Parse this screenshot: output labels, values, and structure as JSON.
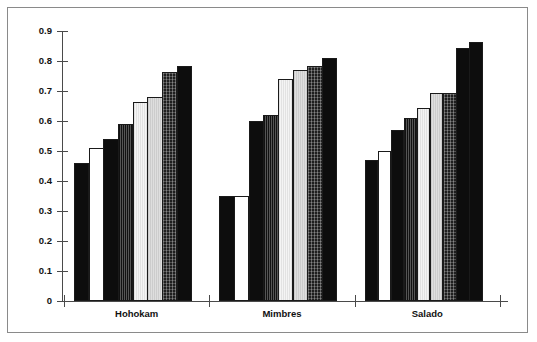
{
  "chart_data": {
    "type": "bar",
    "title": "",
    "subtitle": "",
    "xlabel": "",
    "ylabel": "",
    "categories": [
      "Hohokam",
      "Mimbres",
      "Salado"
    ],
    "ylim": [
      0,
      0.9
    ],
    "yticks": [
      0,
      0.1,
      0.2,
      0.3,
      0.4,
      0.5,
      0.6,
      0.7,
      0.8,
      0.9
    ],
    "ytick_labels": [
      "0",
      "0.1",
      "0.2",
      "0.3",
      "0.4",
      "0.5",
      "0.6",
      "0.7",
      "0.8",
      "0.9"
    ],
    "grid": false,
    "legend": "none",
    "axis_frame": "left-and-bottom",
    "series": [
      {
        "name": "Series 1",
        "fill": "black",
        "values": [
          0.46,
          0.35,
          0.47
        ]
      },
      {
        "name": "Series 2",
        "fill": "white",
        "values": [
          0.51,
          0.35,
          0.5
        ]
      },
      {
        "name": "Series 3",
        "fill": "black",
        "values": [
          0.54,
          0.6,
          0.57
        ]
      },
      {
        "name": "Series 4",
        "fill": "vhatch-dark",
        "values": [
          0.59,
          0.62,
          0.61
        ]
      },
      {
        "name": "Series 5",
        "fill": "light",
        "values": [
          0.665,
          0.74,
          0.645
        ]
      },
      {
        "name": "Series 6",
        "fill": "lightgray",
        "values": [
          0.68,
          0.77,
          0.695
        ]
      },
      {
        "name": "Series 7",
        "fill": "speckle",
        "values": [
          0.765,
          0.785,
          0.695
        ]
      },
      {
        "name": "Series 8",
        "fill": "black",
        "values": [
          0.785,
          0.81,
          0.845
        ]
      },
      {
        "name": "Series 9",
        "fill": "black",
        "values": [
          null,
          null,
          0.865
        ]
      }
    ],
    "group_bar_counts": [
      8,
      8,
      9
    ]
  },
  "axis": {
    "y_labels": [
      "0.9",
      "0.8",
      "0.7",
      "0.6",
      "0.5",
      "0.4",
      "0.3",
      "0.2",
      "0.1",
      "0"
    ]
  },
  "groups": [
    {
      "label": "Hohokam"
    },
    {
      "label": "Mimbres"
    },
    {
      "label": "Salado"
    }
  ],
  "colors": {
    "frame": "#8a8a8a",
    "axis": "#4a4a4a",
    "text": "#111111",
    "bar_dark": "#0d0d0d",
    "bar_light": "#ebebeb",
    "bar_lightgray": "#d5d5d5",
    "bar_speckle": "#1f1f1f",
    "background": "#ffffff"
  }
}
